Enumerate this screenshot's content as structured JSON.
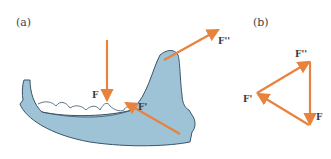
{
  "panels": {
    "a": {
      "label": "(a)"
    },
    "b": {
      "label": "(b)"
    }
  },
  "forces": {
    "a": {
      "F": "F",
      "F_prime": "F'",
      "F_double_prime": "F''"
    },
    "b": {
      "F": "F",
      "F_prime": "F'",
      "F_double_prime": "F''"
    }
  },
  "colors": {
    "arrow": "#e8823c",
    "bone_fill": "#9ec2d6",
    "bone_outline": "#3c5566",
    "text": "#3a3a3a"
  }
}
